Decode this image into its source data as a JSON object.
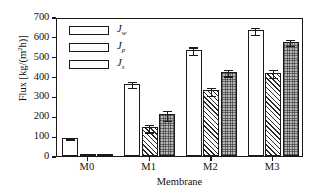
{
  "chart_data": {
    "type": "bar",
    "title": "",
    "xlabel": "Membrane",
    "ylabel": "Flux [kg/(m²h)]",
    "ylabel_base": "Flux [kg/(m",
    "ylabel_exp": "2",
    "ylabel_tail": "h)]",
    "categories": [
      "M0",
      "M1",
      "M2",
      "M3"
    ],
    "ylim": [
      0,
      700
    ],
    "yticks": [
      0,
      100,
      200,
      300,
      400,
      500,
      600,
      700
    ],
    "ytick_labels": [
      "0",
      "100",
      "200",
      "300",
      "400",
      "500",
      "600",
      "700"
    ],
    "grid": false,
    "legend_position": "top-left",
    "series": [
      {
        "name": "J_w",
        "label_main": "J",
        "label_sub": "w",
        "fill": "open-white",
        "values": [
          90,
          365,
          535,
          635
        ],
        "errors": [
          6,
          18,
          22,
          20
        ]
      },
      {
        "name": "J_p",
        "label_main": "J",
        "label_sub": "p",
        "fill": "diagonal-hatch",
        "values": [
          8,
          145,
          330,
          420
        ],
        "errors": [
          3,
          22,
          22,
          22
        ]
      },
      {
        "name": "J_s",
        "label_main": "J",
        "label_sub": "s",
        "fill": "dotted-gray",
        "values": [
          10,
          210,
          425,
          575
        ],
        "errors": [
          3,
          28,
          20,
          18
        ]
      }
    ]
  },
  "axis": {
    "y_title": "Flux [kg/(m2h)]",
    "x_title": "Membrane"
  }
}
